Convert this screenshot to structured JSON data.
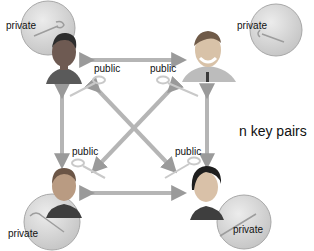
{
  "diagram": {
    "title": "n key pairs",
    "nodes": [
      {
        "id": "top-left",
        "person": "woman with dark hair",
        "private_label": "private",
        "public_label": "public"
      },
      {
        "id": "top-right",
        "person": "man smiling with tie",
        "private_label": "private",
        "public_label": "public"
      },
      {
        "id": "bottom-left",
        "person": "woman with short hair",
        "private_label": "private",
        "public_label": "public"
      },
      {
        "id": "bottom-right",
        "person": "woman with black bob hair",
        "private_label": "private",
        "public_label": "public"
      }
    ],
    "edges": [
      {
        "from": "top-left",
        "to": "top-right",
        "type": "bidirectional"
      },
      {
        "from": "bottom-left",
        "to": "bottom-right",
        "type": "bidirectional"
      },
      {
        "from": "top-left",
        "to": "bottom-left",
        "type": "bidirectional"
      },
      {
        "from": "top-right",
        "to": "bottom-right",
        "type": "bidirectional"
      },
      {
        "from": "top-left",
        "to": "bottom-right",
        "type": "bidirectional"
      },
      {
        "from": "top-right",
        "to": "bottom-left",
        "type": "bidirectional"
      }
    ],
    "labels": {
      "private": "private",
      "public": "public"
    },
    "colors": {
      "arrow_fill": "#b9b9b9",
      "arrow_stroke": "#8a8a8a",
      "circle_fill": "#d6d6d6",
      "circle_stroke": "#a8a8a8",
      "text": "#111111",
      "background": "#ffffff"
    }
  }
}
